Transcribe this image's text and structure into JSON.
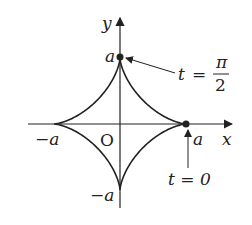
{
  "diagram": {
    "axes": {
      "x_label": "x",
      "y_label": "y",
      "origin_label": "O"
    },
    "ticks": {
      "a_pos_x": "a",
      "a_neg_x": "−a",
      "a_pos_y": "a",
      "a_neg_y": "−a"
    },
    "annotations": [
      {
        "label_t": "t",
        "label_eq": "=",
        "label_num": "π",
        "label_den": "2",
        "points_to": "(0, a)"
      },
      {
        "label": "t = 0",
        "points_to": "(a, 0)"
      }
    ],
    "curve": "x = a cos³t, y = a sin³t"
  }
}
